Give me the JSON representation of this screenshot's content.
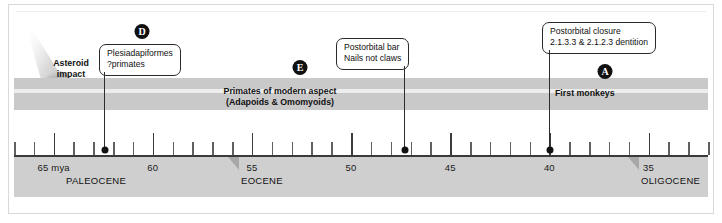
{
  "figure": {
    "type": "timeline",
    "axis": {
      "unit_label": "mya",
      "ticks_major": [
        65,
        60,
        55,
        50,
        45,
        40,
        35
      ],
      "tick_labels": [
        "65  mya",
        "60",
        "55",
        "50",
        "45",
        "40",
        "35"
      ],
      "range": [
        67,
        32
      ],
      "minor_tick_interval": 1
    },
    "epochs": [
      {
        "name": "PALEOCENE",
        "start": 65,
        "has_marker": false
      },
      {
        "name": "EOCENE",
        "start": 55,
        "has_marker": true
      },
      {
        "name": "OLIGOCENE",
        "start": 34,
        "has_marker": true
      }
    ],
    "asteroid": {
      "line1": "Asteroid",
      "line2": "impact",
      "at_mya": 65.5
    },
    "band_labels": [
      {
        "id": "primates-modern-aspect",
        "line1": "Primates of modern aspect",
        "line2": "(Adapoids & Omomyoids)",
        "center_mya": 51.5
      },
      {
        "id": "first-monkeys",
        "line1": "First monkeys",
        "line2": "",
        "center_mya": 37.0
      }
    ],
    "callouts": [
      {
        "id": "plesiadapiformes",
        "badge": "D",
        "line1": "Plesiadapiformes",
        "line2": "?primates",
        "anchor_mya": 64.0
      },
      {
        "id": "postorbital-bar",
        "badge": "E",
        "line1": "Postorbital bar",
        "line2": "Nails not claws",
        "anchor_mya": 45.7
      },
      {
        "id": "postorbital-closure",
        "badge": "A",
        "line1": "Postorbital closure",
        "line2": "2.1.3.3 & 2.1.2.3 dentition",
        "anchor_mya": 37.3
      }
    ],
    "colors": {
      "band": "#c9c9c9",
      "band_stripe": "#ededed",
      "scale_strip": "#cfcfcf",
      "axis": "#3a3a3a",
      "badge": "#111111",
      "epoch_marker": "#a8a8a8"
    }
  }
}
